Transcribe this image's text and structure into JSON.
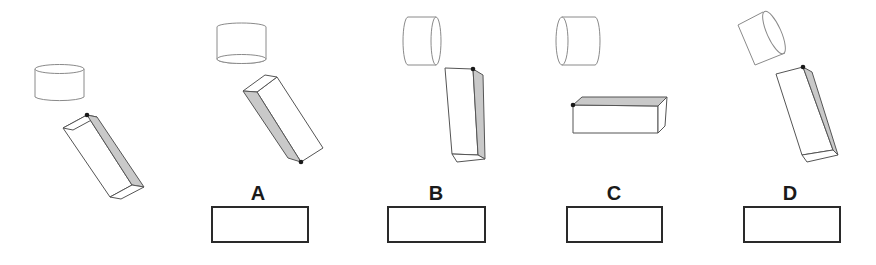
{
  "figure": {
    "reference": {
      "label": ""
    },
    "options": [
      {
        "id": "A",
        "label": "A"
      },
      {
        "id": "B",
        "label": "B"
      },
      {
        "id": "C",
        "label": "C"
      },
      {
        "id": "D",
        "label": "D"
      }
    ],
    "colors": {
      "shaded_face": "#c9c9c9",
      "outline": "#555555",
      "cylinder_outline": "#8a8a8a",
      "answer_box_border": "#2a2a2a",
      "marker_dot": "#1a1a1a",
      "background": "#ffffff"
    }
  }
}
